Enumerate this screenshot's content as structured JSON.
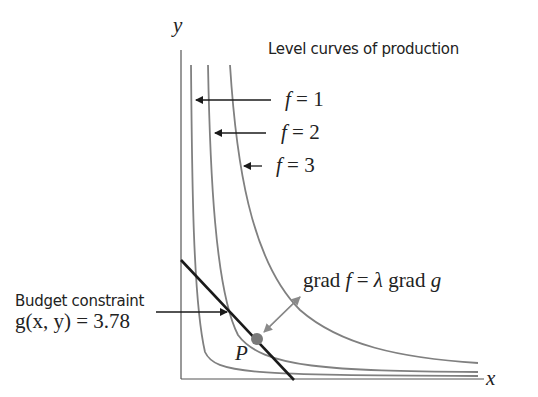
{
  "diagram": {
    "title": "Level curves of production",
    "axes": {
      "x_label": "x",
      "y_label": "y"
    },
    "level_curves": [
      {
        "label": "f = 1",
        "f_sym": "f",
        "eq": "= 1"
      },
      {
        "label": "f = 2",
        "f_sym": "f",
        "eq": "= 2"
      },
      {
        "label": "f = 3",
        "f_sym": "f",
        "eq": "= 3"
      }
    ],
    "constraint": {
      "title": "Budget constraint",
      "equation": "g(x, y) = 3.78"
    },
    "point": {
      "label": "P"
    },
    "gradient": {
      "label_pre": "grad ",
      "f_sym": "f",
      "label_mid": " = ",
      "lambda": "λ",
      "label_post": " grad ",
      "g_sym": "g"
    },
    "colors": {
      "curve": "#808080",
      "constraint": "#1a1a1a",
      "axis": "#555555",
      "point": "#7a7a7a",
      "arrow": "#8a8a8a"
    }
  }
}
